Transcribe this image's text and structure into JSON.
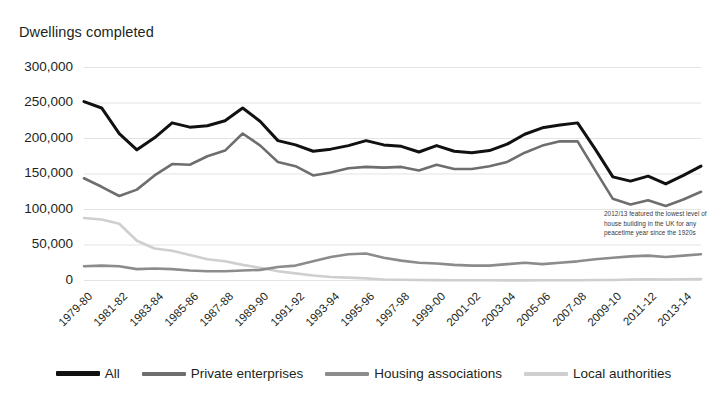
{
  "chart_data": {
    "type": "line",
    "title": "",
    "ylabel": "Dwellings completed",
    "xlabel": "",
    "ylim": [
      0,
      300000
    ],
    "yticks": [
      300000,
      250000,
      200000,
      150000,
      100000,
      50000,
      0
    ],
    "ytick_labels": [
      "300,000",
      "250,000",
      "200,000",
      "150,000",
      "100,000",
      "50,000",
      "0"
    ],
    "grid": true,
    "legend_position": "bottom",
    "x": [
      "1979-80",
      "1980-81",
      "1981-82",
      "1982-83",
      "1983-84",
      "1984-85",
      "1985-86",
      "1986-87",
      "1987-88",
      "1988-89",
      "1989-90",
      "1990-91",
      "1991-92",
      "1992-93",
      "1993-94",
      "1994-95",
      "1995-96",
      "1996-97",
      "1997-98",
      "1998-99",
      "1999-00",
      "2000-01",
      "2001-02",
      "2002-03",
      "2003-04",
      "2004-05",
      "2005-06",
      "2006-07",
      "2007-08",
      "2008-09",
      "2009-10",
      "2010-11",
      "2011-12",
      "2012-13",
      "2013-14",
      "2014-15"
    ],
    "xtick_labels": [
      "1979-80",
      "1981-82",
      "1983-84",
      "1985-86",
      "1987-88",
      "1989-90",
      "1991-92",
      "1993-94",
      "1995-96",
      "1997-98",
      "1999-00",
      "2001-02",
      "2003-04",
      "2005-06",
      "2007-08",
      "2009-10",
      "2011-12",
      "2013-14"
    ],
    "annotations": [
      {
        "text": "2012/13 featured the lowest level of house building in the UK for any peacetime year since the 1920s"
      }
    ],
    "series": [
      {
        "name": "All",
        "color": "#111111",
        "values": [
          252000,
          243000,
          207000,
          184000,
          201000,
          222000,
          216000,
          218000,
          225000,
          243000,
          224000,
          197000,
          191000,
          182000,
          185000,
          190000,
          197000,
          191000,
          189000,
          181000,
          190000,
          182000,
          180000,
          183000,
          192000,
          206000,
          215000,
          219000,
          222000,
          185000,
          146000,
          140000,
          147000,
          136000,
          148000,
          161000
        ]
      },
      {
        "name": "Private enterprises",
        "color": "#6e6e6e",
        "values": [
          144000,
          132000,
          119000,
          128000,
          148000,
          164000,
          163000,
          175000,
          183000,
          207000,
          190000,
          167000,
          161000,
          148000,
          152000,
          158000,
          160000,
          159000,
          160000,
          155000,
          163000,
          157000,
          157000,
          161000,
          167000,
          180000,
          190000,
          196000,
          196000,
          155000,
          115000,
          107000,
          113000,
          105000,
          114000,
          125000
        ]
      },
      {
        "name": "Housing associations",
        "color": "#8c8c8c",
        "values": [
          20000,
          21000,
          20000,
          16000,
          17000,
          16000,
          14000,
          13000,
          13000,
          14000,
          15000,
          19000,
          21000,
          27000,
          33000,
          37000,
          38000,
          32000,
          28000,
          25000,
          24000,
          22000,
          21000,
          21000,
          23000,
          25000,
          23000,
          25000,
          27000,
          30000,
          32000,
          34000,
          35000,
          33000,
          35000,
          37000
        ]
      },
      {
        "name": "Local authorities",
        "color": "#cfcfcf",
        "values": [
          88000,
          86000,
          80000,
          56000,
          45000,
          42000,
          36000,
          30000,
          27000,
          22000,
          18000,
          13000,
          10000,
          7000,
          5000,
          4000,
          3000,
          1500,
          1000,
          700,
          500,
          400,
          300,
          250,
          200,
          200,
          300,
          300,
          250,
          600,
          800,
          1500,
          1800,
          1500,
          1800,
          2000
        ]
      }
    ]
  },
  "legend": {
    "items": [
      {
        "label": "All",
        "color": "#111111"
      },
      {
        "label": "Private enterprises",
        "color": "#6e6e6e"
      },
      {
        "label": "Housing associations",
        "color": "#8c8c8c"
      },
      {
        "label": "Local authorities",
        "color": "#cfcfcf"
      }
    ]
  },
  "annotation_text": "2012/13 featured the lowest level of house building in the UK for any peacetime year since the 1920s"
}
